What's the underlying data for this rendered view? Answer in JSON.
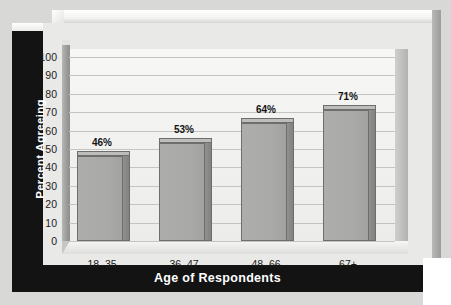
{
  "chart_data": {
    "type": "bar",
    "title": "",
    "xlabel": "Age of Respondents",
    "ylabel": "Percent Agreeing",
    "categories": [
      "18–35",
      "36–47",
      "48–66",
      "67+"
    ],
    "values": [
      46,
      53,
      64,
      71
    ],
    "data_labels": [
      "46%",
      "53%",
      "64%",
      "71%"
    ],
    "ylim": [
      0,
      100
    ],
    "yticks": [
      0,
      10,
      20,
      30,
      40,
      50,
      60,
      70,
      80,
      90,
      100
    ],
    "ytick_labels": [
      "0",
      "10",
      "20",
      "30",
      "40",
      "50",
      "60",
      "70",
      "80",
      "90",
      "100"
    ],
    "grid": true,
    "legend": false,
    "style": "3d-bar",
    "colors": {
      "bar_face": "#a9a9a7",
      "bar_side": "#8a8a88",
      "bar_outline": "#6e6e6c",
      "plot_background": "#f1f1ef",
      "panel_background": "#e9e9e7",
      "band": "#131313",
      "band_text": "#ffffff",
      "gridline": "#c4c4c2",
      "tick_text": "#1b1b1b"
    }
  }
}
